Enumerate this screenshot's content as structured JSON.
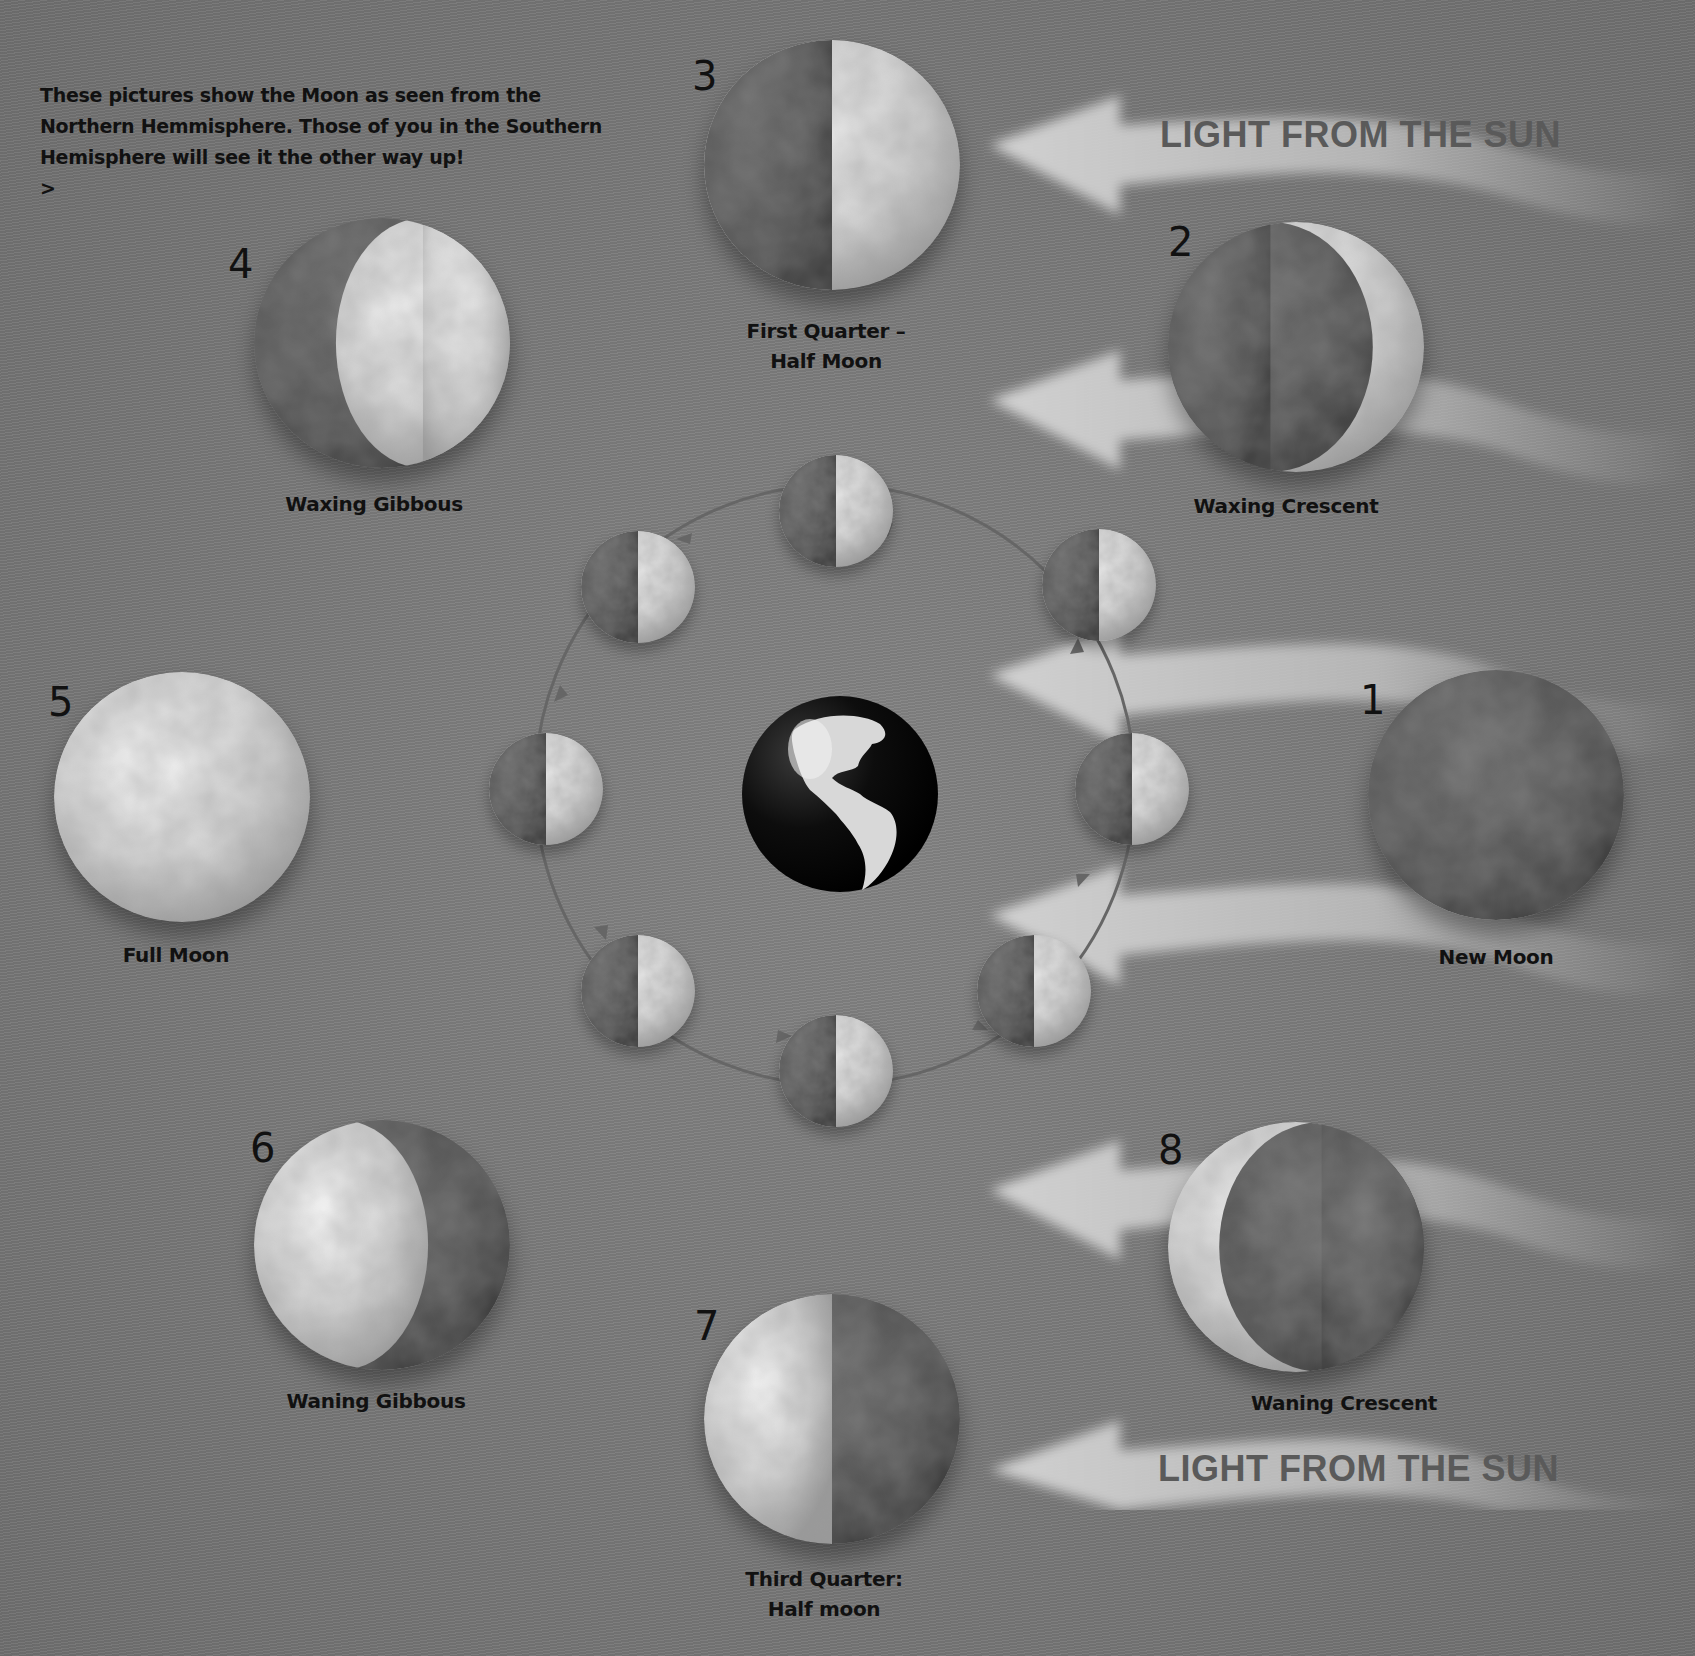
{
  "intro": {
    "lines": [
      "These pictures show the Moon as seen from the",
      "Northern Hemmisphere. Those of you in the Southern",
      "Hemisphere will see it the other way up!",
      ">"
    ]
  },
  "sun_labels": {
    "top": "LIGHT FROM THE SUN",
    "bottom": "LIGHT FROM THE SUN"
  },
  "phases": [
    {
      "number": "1",
      "name": "New Moon",
      "lines": [
        "New Moon"
      ],
      "lit": "none"
    },
    {
      "number": "2",
      "name": "Waxing Crescent",
      "lines": [
        "Waxing Crescent"
      ],
      "lit": "right-crescent"
    },
    {
      "number": "3",
      "name": "First Quarter – Half Moon",
      "lines": [
        "First Quarter –",
        "Half Moon"
      ],
      "lit": "right-half"
    },
    {
      "number": "4",
      "name": "Waxing Gibbous",
      "lines": [
        "Waxing Gibbous"
      ],
      "lit": "right-gibbous"
    },
    {
      "number": "5",
      "name": "Full Moon",
      "lines": [
        "Full Moon"
      ],
      "lit": "full"
    },
    {
      "number": "6",
      "name": "Waning Gibbous",
      "lines": [
        "Waning Gibbous"
      ],
      "lit": "left-gibbous"
    },
    {
      "number": "7",
      "name": "Third Quarter: Half moon",
      "lines": [
        "Third Quarter:",
        "Half moon"
      ],
      "lit": "left-half"
    },
    {
      "number": "8",
      "name": "Waning Crescent",
      "lines": [
        "Waning Crescent"
      ],
      "lit": "left-crescent"
    }
  ],
  "orbit": {
    "center": "earth",
    "moon_count": 8,
    "moon_lit_side": "right-half",
    "direction": "counter-clockwise"
  },
  "colors": {
    "background": "#7b7b7b",
    "moon_light": "#dcdcdc",
    "moon_dark": "#555555",
    "text": "#111111",
    "sun_label": "#5a5a5a",
    "beam": "#c8c8c8"
  }
}
